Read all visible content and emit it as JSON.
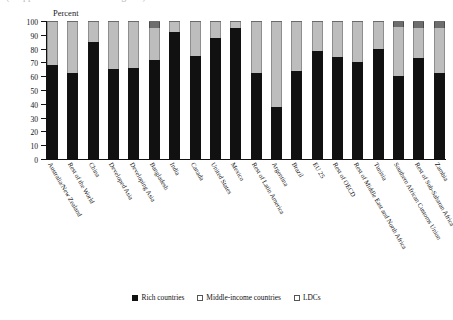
{
  "title_strip": {
    "text": "(cropped header text — illegible)"
  },
  "axis": {
    "unit_label": "Percent",
    "yticks": [
      0,
      10,
      20,
      30,
      40,
      50,
      60,
      70,
      80,
      90,
      100
    ]
  },
  "legend": {
    "items": [
      {
        "label": "Rich countries",
        "color": "#111111",
        "key": "rich"
      },
      {
        "label": "Middle-income countries",
        "color": "#d2d2d2",
        "key": "middle"
      },
      {
        "label": "LDCs",
        "color": "#6e6e6e",
        "key": "ldcs"
      }
    ]
  },
  "chart_data": {
    "type": "bar",
    "stacked": true,
    "stack_total": 100,
    "title": "",
    "xlabel": "",
    "ylabel": "Percent",
    "ylim": [
      0,
      100
    ],
    "ytick_step": 10,
    "grid": false,
    "legend_position": "bottom",
    "categories": [
      "Australia/New Zealand",
      "Rest of the World",
      "China",
      "Developed Asia",
      "Developing Asia",
      "Bangladesh",
      "India",
      "Canada",
      "United States",
      "Mexico",
      "Rest of Latin America",
      "Argentina",
      "Brazil",
      "EU 25",
      "Rest of OECD",
      "Rest of Middle East and North Africa",
      "Tunisia",
      "Southern African Customs Union",
      "Rest of Sub-Saharan Africa",
      "Zambia"
    ],
    "series": [
      {
        "name": "Rich countries",
        "color": "#111111",
        "values": [
          68,
          62,
          85,
          65,
          66,
          72,
          92,
          75,
          88,
          95,
          62,
          38,
          64,
          78,
          74,
          70,
          80,
          60,
          73,
          62
        ]
      },
      {
        "name": "Middle-income countries",
        "color": "#bdbdbd",
        "values": [
          32,
          38,
          15,
          35,
          34,
          23,
          8,
          25,
          12,
          5,
          38,
          62,
          36,
          22,
          26,
          30,
          20,
          36,
          22,
          33
        ]
      },
      {
        "name": "LDCs",
        "color": "#6e6e6e",
        "values": [
          0,
          0,
          0,
          0,
          0,
          5,
          0,
          0,
          0,
          0,
          0,
          0,
          0,
          0,
          0,
          0,
          0,
          4,
          5,
          5
        ]
      }
    ]
  }
}
